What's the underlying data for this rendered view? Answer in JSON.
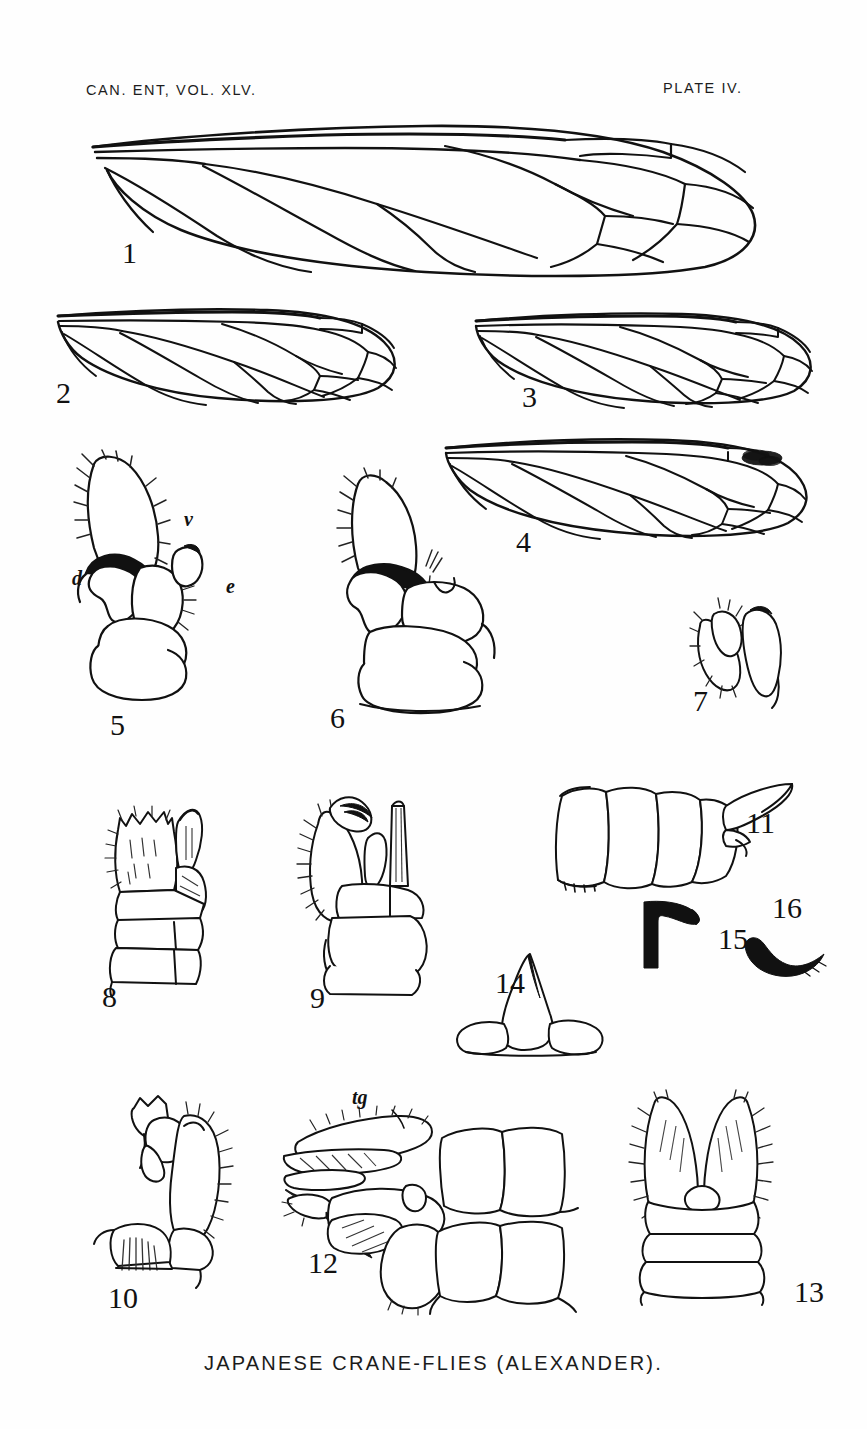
{
  "page": {
    "header_left": "CAN. ENT, VOL. XLV.",
    "header_right": "PLATE IV.",
    "caption": "JAPANESE CRANE-FLIES (ALEXANDER).",
    "ink_color": "#111111",
    "paper_color": "#fefefe"
  },
  "figures": [
    {
      "num": "1",
      "kind": "wing",
      "desc": "crane-fly wing, venation, large"
    },
    {
      "num": "2",
      "kind": "wing",
      "desc": "crane-fly wing, venation"
    },
    {
      "num": "3",
      "kind": "wing",
      "desc": "crane-fly wing, venation"
    },
    {
      "num": "4",
      "kind": "wing",
      "desc": "crane-fly wing with dark stigma"
    },
    {
      "num": "5",
      "kind": "hypopygium",
      "desc": "male hypopygium, lateral"
    },
    {
      "num": "6",
      "kind": "hypopygium",
      "desc": "male hypopygium, lateral"
    },
    {
      "num": "7",
      "kind": "hypopygium",
      "desc": "genital appendage detail"
    },
    {
      "num": "8",
      "kind": "hypopygium",
      "desc": "male hypopygium, dorsal"
    },
    {
      "num": "9",
      "kind": "hypopygium",
      "desc": "male hypopygium, dorsal"
    },
    {
      "num": "10",
      "kind": "hypopygium",
      "desc": "male hypopygium, lateral"
    },
    {
      "num": "11",
      "kind": "abdomen",
      "desc": "female ovipositor, lateral"
    },
    {
      "num": "12",
      "kind": "hypopygium",
      "desc": "male hypopygium with tergite"
    },
    {
      "num": "13",
      "kind": "hypopygium",
      "desc": "male hypopygium, dorsal forceps"
    },
    {
      "num": "14",
      "kind": "sclerite",
      "desc": "tergite with median spine"
    },
    {
      "num": "15",
      "kind": "sclerite",
      "desc": "dark hook-shaped appendage"
    },
    {
      "num": "16",
      "kind": "sclerite",
      "desc": "dark curved appendage"
    }
  ],
  "annotations": [
    {
      "label": "d",
      "figure": "5"
    },
    {
      "label": "v",
      "figure": "5"
    },
    {
      "label": "e",
      "figure": "5"
    },
    {
      "label": "tg",
      "figure": "12"
    }
  ]
}
